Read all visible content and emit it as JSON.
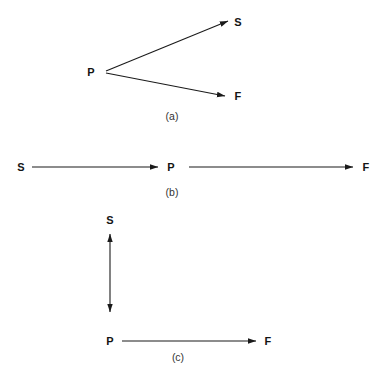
{
  "figure": {
    "background_color": "#ffffff",
    "stroke_color": "#1a1a1a",
    "label_color": "#141414",
    "caption_color": "#333333",
    "panels": [
      {
        "id": "a",
        "caption": "(a)",
        "caption_pos": {
          "x": 172,
          "y": 116
        },
        "nodes": [
          {
            "name": "P",
            "label": "P",
            "x": 91,
            "y": 72
          },
          {
            "name": "S",
            "label": "S",
            "x": 238,
            "y": 22
          },
          {
            "name": "F",
            "label": "F",
            "x": 238,
            "y": 96
          }
        ],
        "arrows": [
          {
            "from": "P",
            "to": "S",
            "x1": 106,
            "y1": 71,
            "x2": 228,
            "y2": 21,
            "heads": "end"
          },
          {
            "from": "P",
            "to": "F",
            "x1": 106,
            "y1": 73,
            "x2": 225,
            "y2": 96,
            "heads": "end"
          }
        ]
      },
      {
        "id": "b",
        "caption": "(b)",
        "caption_pos": {
          "x": 172,
          "y": 192
        },
        "nodes": [
          {
            "name": "S",
            "label": "S",
            "x": 21,
            "y": 167
          },
          {
            "name": "P",
            "label": "P",
            "x": 171,
            "y": 167
          },
          {
            "name": "F",
            "label": "F",
            "x": 366,
            "y": 167
          }
        ],
        "arrows": [
          {
            "from": "S",
            "to": "P",
            "x1": 32,
            "y1": 167,
            "x2": 158,
            "y2": 167,
            "heads": "end"
          },
          {
            "from": "P",
            "to": "F",
            "x1": 189,
            "y1": 167,
            "x2": 353,
            "y2": 167,
            "heads": "end"
          }
        ]
      },
      {
        "id": "c",
        "caption": "(c)",
        "caption_pos": {
          "x": 178,
          "y": 357
        },
        "nodes": [
          {
            "name": "S",
            "label": "S",
            "x": 110,
            "y": 220
          },
          {
            "name": "P",
            "label": "P",
            "x": 110,
            "y": 341
          },
          {
            "name": "F",
            "label": "F",
            "x": 268,
            "y": 341
          }
        ],
        "arrows": [
          {
            "from": "P",
            "to": "S",
            "x1": 110,
            "y1": 312,
            "x2": 110,
            "y2": 234,
            "heads": "both"
          },
          {
            "from": "P",
            "to": "F",
            "x1": 122,
            "y1": 341,
            "x2": 256,
            "y2": 341,
            "heads": "end"
          }
        ]
      }
    ]
  }
}
